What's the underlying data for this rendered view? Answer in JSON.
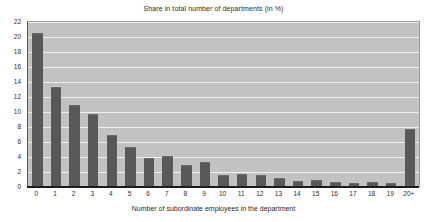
{
  "chart_data": {
    "type": "bar",
    "title": "Share in total number of departments (in %)",
    "xlabel": "Number of subordinate employees in the department",
    "ylabel": "",
    "categories": [
      "0",
      "1",
      "2",
      "3",
      "4",
      "5",
      "6",
      "7",
      "8",
      "9",
      "10",
      "11",
      "12",
      "13",
      "14",
      "15",
      "16",
      "17",
      "18",
      "19",
      "20+"
    ],
    "values": [
      20.5,
      13.4,
      11.0,
      9.8,
      6.9,
      5.3,
      3.9,
      4.2,
      2.9,
      3.3,
      1.6,
      1.8,
      1.6,
      1.2,
      0.8,
      0.9,
      0.7,
      0.5,
      0.7,
      0.5,
      7.7
    ],
    "ylim": [
      0,
      22
    ],
    "ytick_step": 2,
    "yticks": [
      "0",
      "2",
      "4",
      "6",
      "8",
      "10",
      "12",
      "14",
      "16",
      "18",
      "20",
      "22"
    ],
    "grid": true,
    "legend": "none",
    "series": [
      {
        "name": "Share in total number of departments (in %)",
        "values": [
          20.5,
          13.4,
          11.0,
          9.8,
          6.9,
          5.3,
          3.9,
          4.2,
          2.9,
          3.3,
          1.6,
          1.8,
          1.6,
          1.2,
          0.8,
          0.9,
          0.7,
          0.5,
          0.7,
          0.5,
          7.7
        ]
      }
    ]
  },
  "colors": {
    "bar_fill": "#595959",
    "plot_background": "#c2c2c2",
    "gridline": "#efefef",
    "axis_line": "#1d1d1d",
    "text": "#2b2b2b",
    "page_background": "#ffffff"
  }
}
